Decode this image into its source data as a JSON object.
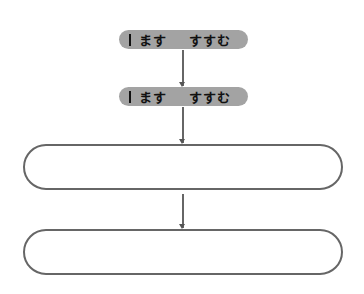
{
  "diagram": {
    "type": "flowchart",
    "nodes": [
      {
        "id": "pill1",
        "shape": "pill",
        "prefix_mark": "|",
        "word1": "ます",
        "word2": "すすむ",
        "fill": "#a3a3a3"
      },
      {
        "id": "pill2",
        "shape": "pill",
        "prefix_mark": "|",
        "word1": "ます",
        "word2": "すすむ",
        "fill": "#a3a3a3"
      },
      {
        "id": "box1",
        "shape": "rounded-rect",
        "text": ""
      },
      {
        "id": "box2",
        "shape": "rounded-rect",
        "text": ""
      }
    ],
    "edges": [
      {
        "from": "pill1",
        "to": "pill2"
      },
      {
        "from": "pill2",
        "to": "box1"
      },
      {
        "from": "box1",
        "to": "box2"
      }
    ]
  }
}
